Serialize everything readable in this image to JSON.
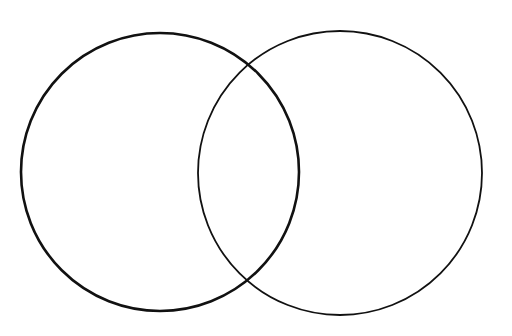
{
  "diagram": {
    "type": "venn",
    "background": "#ffffff",
    "sets": [
      {
        "name": "set-left",
        "label": "",
        "cx": 160,
        "cy": 172,
        "r": 139,
        "stroke": "#111111",
        "stroke_width": 2.6
      },
      {
        "name": "set-right",
        "label": "",
        "cx": 340,
        "cy": 173,
        "r": 142,
        "stroke": "#111111",
        "stroke_width": 1.8
      }
    ],
    "labels": []
  }
}
